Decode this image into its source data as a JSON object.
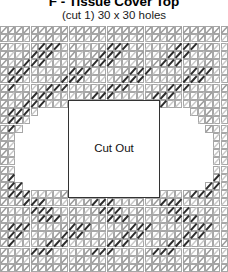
{
  "header": {
    "title": "F - Tissue Cover Top",
    "subtitle": "(cut 1) 30 x 30 holes"
  },
  "cutout": {
    "label": "Cut Out"
  },
  "chart_data": {
    "type": "heatmap",
    "title": "F - Tissue Cover Top",
    "subtitle": "(cut 1) 30 x 30 holes",
    "xlabel": "",
    "ylabel": "",
    "grid": true,
    "legend_position": "none",
    "columns": 30,
    "rows": 30,
    "cell_px": 7.6,
    "colors": {
      "background": "#ffffff",
      "mesh_line": "#8a8a8a",
      "stitch_light": "#c9c9c9",
      "stitch_mid": "#9a9a9a",
      "stitch_dark": "#2b2b2b",
      "cutout_border": "#333333",
      "text": "#000000"
    },
    "symbols": [
      {
        "key": "light",
        "name": "light diagonal stitch",
        "color": "#c9c9c9"
      },
      {
        "key": "mid",
        "name": "medium diagonal stitch",
        "color": "#9a9a9a"
      },
      {
        "key": "dark",
        "name": "dark diagonal stitch",
        "color": "#2b2b2b"
      }
    ],
    "cutout_region": {
      "col_start": 9,
      "col_end": 21,
      "row_start": 9,
      "row_end": 21,
      "label": "Cut Out"
    },
    "values": [
      "mmmmmmmmmmmmmmmmmmmmmmmmmmmmmm",
      "mlmlmlmlmlmlmlmlmlmlmlmlmlmlml",
      "mlllmdddlmlllmdddlmlllmdddlmllm",
      "mllmdddllmllmdddllmllmdddllmllm",
      "mlmdddlllmlmdddlllmlmdddlllmllm",
      "mdddllllmdddllllmdddllllmdddllm",
      "mddllllmdddllllmdddllllmdddlllm",
      "mdlllmdddllllmdddllllmdddllllmm",
      "mllmdddllllmdddllllmdddllllmllm",
      "mlmdddllllmdddllllmdddllllmlllm",
      "mdddlCCCCCCCCCCCCCCCCCCCCllmllm",
      "mddlCCCCCCCCCCCCCCCCCCCCCClmllm",
      "mdlCCCCCCCCCCCCCCCCCCCCCCCCmllm",
      "mlCCCCCCCCCCCCCCCCCCCCCCCCCClim",
      "mlCCCCCCCCCCCCCCCCCCCCCCCCCCllm",
      "mlCCCCCCCCCCCCCCCCCCCCCCCCCCllm",
      "mlCCCCCCCCCCCCCCCCCCCCCCCCCCllm",
      "mlCCCCCCCCCCCCCCCCCCCCCCCCCCllm",
      "mdCCCCCCCCCCCCCCCCCCCCCCCCCCdlm",
      "mddCCCCCCCCCCCCCCCCCCCCCCCCddlm",
      "mdddllllmdddllllmdddllllmdddllm",
      "mlmdddlllmlmdddlllmlmdddlllmllm",
      "mllmdddllmllmdddllmllmdddllmllm",
      "mlllmdddlmlllmdddlmlllmdddlmllm",
      "mdddllllmdddllllmdddllllmdddllm",
      "mddllllmdddllllmdddllllmdddlllm",
      "mdlllmdddllllmdddllllmdddllllmm",
      "mllmdddllllmdddllllmdddllllmllm",
      "mlmlmlmlmlmlmlmlmlmlmlmlmlmlml",
      "mmmmmmmmmmmmmmmmmmmmmmmmmmmmmm"
    ]
  }
}
